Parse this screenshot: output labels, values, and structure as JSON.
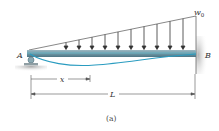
{
  "diagram": {
    "type": "beam-loading",
    "labels": {
      "left_support": "A",
      "right_support": "B",
      "load_intensity": "w",
      "load_subscript": "0",
      "position_var": "x",
      "length_var": "L",
      "caption": "(a)"
    },
    "load": {
      "distribution": "triangular",
      "arrow_count": 10
    },
    "colors": {
      "beam": "#7fa7b4",
      "beam_highlight": "#5fc3d6",
      "deflection_curve": "#2a9cc0",
      "line": "#555555",
      "ground": "#9a9a9a"
    }
  }
}
